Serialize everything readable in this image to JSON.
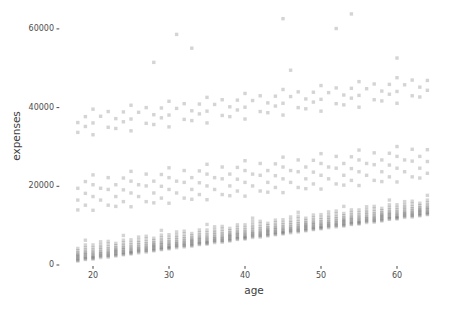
{
  "chart_data": {
    "type": "scatter",
    "title": "",
    "xlabel": "age",
    "ylabel": "expenses",
    "xlim": [
      17,
      65.5
    ],
    "ylim": [
      0,
      65000
    ],
    "x_ticks": [
      20,
      30,
      40,
      50,
      60
    ],
    "y_ticks": [
      0,
      20000,
      40000,
      60000
    ],
    "grid": false,
    "legend": "none",
    "background_color": "#ffffff",
    "point_color": "#3a3a3a",
    "point_opacity": 0.22,
    "point_size_px": 3.4,
    "axis_text_color": "#4d4d4d",
    "axis_title_color": "#3d3d3d",
    "tick_mark_color": "#333333",
    "expenses_value_unit_dollars": 100,
    "points_by_age": {
      "18": [
        10,
        12,
        15,
        18,
        21,
        24,
        27,
        31,
        36,
        42,
        140,
        165,
        195,
        337,
        362
      ],
      "19": [
        14,
        16,
        19,
        22,
        26,
        29,
        33,
        38,
        44,
        51,
        63,
        152,
        182,
        212,
        352,
        377
      ],
      "20": [
        15,
        17,
        19,
        22,
        25,
        29,
        33,
        38,
        44,
        51,
        139,
        174,
        204,
        229,
        331,
        361,
        396
      ],
      "21": [
        19,
        22,
        25,
        28,
        31,
        35,
        40,
        45,
        51,
        59,
        165,
        195,
        378
      ],
      "22": [
        20,
        23,
        25,
        29,
        32,
        36,
        41,
        46,
        53,
        60,
        152,
        192,
        222,
        350,
        390
      ],
      "23": [
        23,
        25,
        28,
        31,
        34,
        37,
        40,
        44,
        49,
        55,
        149,
        174,
        204,
        347,
        372
      ],
      "24": [
        26,
        28,
        31,
        34,
        38,
        41,
        45,
        50,
        56,
        63,
        75,
        161,
        191,
        221,
        364,
        389
      ],
      "25": [
        28,
        30,
        32,
        35,
        38,
        42,
        46,
        51,
        57,
        64,
        148,
        183,
        213,
        238,
        341,
        371,
        406
      ],
      "26": [
        31,
        34,
        37,
        40,
        43,
        47,
        52,
        57,
        63,
        71,
        174,
        204,
        388
      ],
      "27": [
        33,
        36,
        38,
        42,
        45,
        49,
        54,
        59,
        66,
        73,
        161,
        201,
        231,
        360,
        400
      ],
      "28": [
        36,
        38,
        41,
        44,
        47,
        50,
        53,
        57,
        62,
        68,
        158,
        183,
        213,
        357,
        382,
        515
      ],
      "29": [
        39,
        41,
        44,
        47,
        51,
        54,
        58,
        63,
        69,
        76,
        88,
        170,
        200,
        230,
        374,
        399
      ],
      "30": [
        41,
        43,
        45,
        48,
        51,
        55,
        59,
        64,
        70,
        77,
        157,
        192,
        222,
        247,
        351,
        381,
        416
      ],
      "31": [
        44,
        47,
        50,
        53,
        56,
        60,
        65,
        70,
        76,
        84,
        183,
        213,
        398,
        586
      ],
      "32": [
        46,
        49,
        51,
        55,
        58,
        62,
        67,
        72,
        79,
        86,
        170,
        210,
        240,
        370,
        410
      ],
      "33": [
        48,
        50,
        53,
        56,
        59,
        62,
        65,
        69,
        74,
        80,
        167,
        192,
        222,
        367,
        392,
        551
      ],
      "34": [
        52,
        54,
        57,
        60,
        64,
        67,
        71,
        76,
        82,
        89,
        179,
        209,
        239,
        384,
        409
      ],
      "35": [
        53,
        55,
        57,
        60,
        63,
        67,
        71,
        76,
        82,
        89,
        103,
        166,
        201,
        231,
        256,
        361,
        391,
        426
      ],
      "36": [
        57,
        60,
        63,
        66,
        69,
        73,
        78,
        83,
        89,
        97,
        192,
        222,
        408
      ],
      "37": [
        58,
        61,
        63,
        67,
        70,
        74,
        79,
        84,
        91,
        98,
        179,
        219,
        249,
        380,
        420
      ],
      "38": [
        61,
        63,
        66,
        69,
        72,
        75,
        78,
        82,
        87,
        93,
        176,
        201,
        231,
        377,
        402
      ],
      "39": [
        65,
        67,
        70,
        73,
        77,
        80,
        84,
        89,
        95,
        102,
        188,
        218,
        248,
        394,
        419
      ],
      "40": [
        66,
        68,
        70,
        73,
        76,
        80,
        84,
        89,
        95,
        102,
        175,
        210,
        240,
        265,
        371,
        401,
        436
      ],
      "41": [
        70,
        73,
        76,
        79,
        82,
        86,
        91,
        96,
        102,
        110,
        119,
        201,
        231,
        418
      ],
      "42": [
        71,
        74,
        76,
        80,
        83,
        87,
        92,
        97,
        104,
        111,
        188,
        228,
        258,
        390,
        430
      ],
      "43": [
        74,
        76,
        79,
        82,
        85,
        88,
        91,
        95,
        100,
        106,
        185,
        210,
        240,
        387,
        412
      ],
      "44": [
        77,
        79,
        82,
        85,
        89,
        92,
        96,
        101,
        107,
        114,
        197,
        227,
        257,
        404,
        429
      ],
      "45": [
        79,
        81,
        83,
        86,
        89,
        93,
        97,
        102,
        108,
        115,
        184,
        219,
        249,
        274,
        381,
        411,
        446,
        626
      ],
      "46": [
        82,
        85,
        88,
        91,
        94,
        98,
        103,
        108,
        114,
        122,
        210,
        240,
        428,
        495
      ],
      "47": [
        84,
        87,
        89,
        93,
        96,
        100,
        105,
        110,
        117,
        124,
        134,
        197,
        237,
        267,
        400,
        440
      ],
      "48": [
        87,
        89,
        92,
        95,
        98,
        101,
        104,
        108,
        113,
        119,
        194,
        219,
        249,
        397,
        422
      ],
      "49": [
        90,
        92,
        95,
        98,
        102,
        105,
        109,
        114,
        120,
        127,
        206,
        236,
        266,
        414,
        439
      ],
      "50": [
        92,
        94,
        96,
        99,
        102,
        106,
        110,
        115,
        121,
        128,
        193,
        228,
        258,
        283,
        391,
        421,
        456
      ],
      "51": [
        95,
        98,
        101,
        104,
        107,
        111,
        116,
        121,
        127,
        135,
        219,
        249,
        438
      ],
      "52": [
        97,
        100,
        102,
        106,
        109,
        113,
        118,
        123,
        130,
        137,
        206,
        246,
        276,
        410,
        450,
        601
      ],
      "53": [
        99,
        101,
        104,
        107,
        110,
        113,
        116,
        120,
        125,
        131,
        149,
        203,
        228,
        258,
        407,
        432
      ],
      "54": [
        103,
        105,
        108,
        111,
        115,
        118,
        122,
        127,
        133,
        140,
        215,
        245,
        275,
        424,
        449,
        638
      ],
      "55": [
        104,
        106,
        108,
        111,
        114,
        118,
        122,
        127,
        133,
        140,
        202,
        237,
        267,
        292,
        401,
        431,
        466
      ],
      "56": [
        108,
        111,
        114,
        117,
        120,
        124,
        129,
        134,
        140,
        148,
        228,
        258,
        448
      ],
      "57": [
        109,
        112,
        114,
        118,
        121,
        125,
        130,
        135,
        142,
        149,
        215,
        255,
        285,
        420,
        460
      ],
      "58": [
        112,
        114,
        117,
        120,
        123,
        126,
        129,
        133,
        138,
        144,
        212,
        237,
        267,
        417,
        442
      ],
      "59": [
        116,
        118,
        121,
        124,
        128,
        131,
        135,
        140,
        146,
        153,
        165,
        224,
        254,
        284,
        434,
        459
      ],
      "60": [
        117,
        119,
        121,
        124,
        127,
        131,
        135,
        140,
        146,
        153,
        211,
        246,
        276,
        301,
        411,
        441,
        476,
        526
      ],
      "61": [
        121,
        124,
        127,
        130,
        133,
        137,
        142,
        147,
        153,
        161,
        237,
        267,
        458
      ],
      "62": [
        122,
        125,
        127,
        131,
        134,
        138,
        143,
        148,
        155,
        162,
        224,
        264,
        294,
        430,
        470
      ],
      "63": [
        125,
        127,
        130,
        133,
        136,
        139,
        142,
        146,
        151,
        157,
        221,
        246,
        276,
        427,
        452
      ],
      "64": [
        128,
        130,
        133,
        136,
        140,
        143,
        147,
        152,
        158,
        165,
        177,
        233,
        263,
        293,
        444,
        469
      ]
    }
  }
}
